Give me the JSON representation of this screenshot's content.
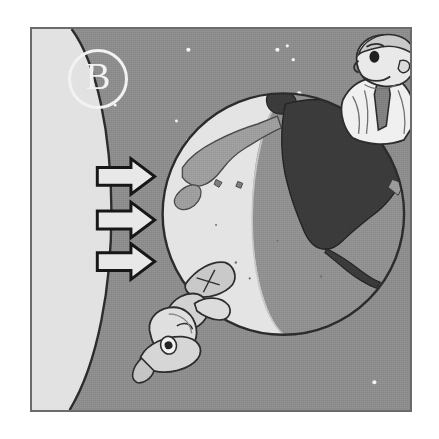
{
  "figure": {
    "panel_label": "B",
    "caption_alt": "Panel B: the Sun's rays strike Earth; the day side faces the Sun and the night side is in shadow.",
    "background_color": "#8c8c8c",
    "frame_color": "#6b6b6b"
  },
  "sun": {
    "name": "sun-limb",
    "color": "#e2e2e2",
    "edge_color": "#2b2b2b",
    "position": "left-edge-arc"
  },
  "rays": {
    "label": "sunlight-arrows",
    "count": 3,
    "direction": "right",
    "fill_color": "#e8e8e8",
    "outline_color": "#161616",
    "arrows": [
      {
        "id": "ray-top",
        "y": 176
      },
      {
        "id": "ray-middle",
        "y": 220
      },
      {
        "id": "ray-bottom",
        "y": 262
      }
    ]
  },
  "earth": {
    "name": "earth-globe",
    "center_x": 284,
    "center_y": 214,
    "radius": 122,
    "day_side_color": "#e4e4e4",
    "night_side_color": "#8f8f8f",
    "day_land_color": "#9a9a9a",
    "night_land_color": "#3a3a3a",
    "outline_color": "#2b2b2b",
    "terminator_label": "day-night-terminator",
    "landmasses": [
      {
        "name": "asia-japan",
        "side": "day"
      },
      {
        "name": "north-america",
        "side": "night"
      },
      {
        "name": "greenland",
        "side": "night"
      }
    ]
  },
  "characters": [
    {
      "id": "man-daytime",
      "name": "cartoon-man-awake",
      "position": "top-right-of-globe",
      "description": "man in shirt and necktie standing on the day side",
      "skin_color": "#e9e9e9",
      "shirt_color": "#f0f0f0",
      "tie_color": "#777777"
    },
    {
      "id": "man-nighttime",
      "name": "cartoon-man-sleeping",
      "position": "bottom-left-of-globe",
      "description": "upside-down sleeping man hanging below the globe wearing a nightcap",
      "skin_color": "#dcdcdc",
      "clothes_color": "#b9b9b9"
    }
  ],
  "stars": {
    "name": "background-stars",
    "color": "#f2f2f2",
    "points": [
      {
        "x": 188,
        "y": 48
      },
      {
        "x": 278,
        "y": 48
      },
      {
        "x": 288,
        "y": 44
      },
      {
        "x": 294,
        "y": 58
      },
      {
        "x": 300,
        "y": 92
      },
      {
        "x": 188,
        "y": 140
      },
      {
        "x": 176,
        "y": 120
      },
      {
        "x": 376,
        "y": 384
      },
      {
        "x": 112,
        "y": 104
      }
    ]
  }
}
